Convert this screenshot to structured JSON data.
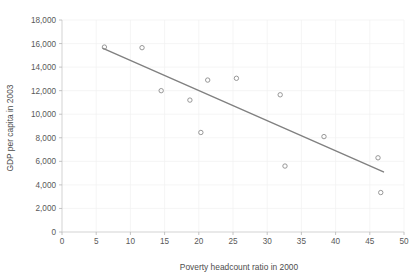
{
  "chart_data": {
    "type": "scatter",
    "title": "",
    "xlabel": "Poverty headcount ratio  in 2000",
    "ylabel": "GDP per capita in 2003",
    "xlim": [
      0,
      50
    ],
    "ylim": [
      0,
      18000
    ],
    "grid": true,
    "legend": "none",
    "xticks": [
      "0",
      "5",
      "10",
      "15",
      "20",
      "25",
      "30",
      "35",
      "40",
      "45",
      "50"
    ],
    "xtick_values": [
      0,
      5,
      10,
      15,
      20,
      25,
      30,
      35,
      40,
      45,
      50
    ],
    "yticks": [
      "0",
      "2,000",
      "4,000",
      "6,000",
      "8,000",
      "10,000",
      "12,000",
      "14,000",
      "16,000",
      "18,000"
    ],
    "ytick_values": [
      0,
      2000,
      4000,
      6000,
      8000,
      10000,
      12000,
      14000,
      16000,
      18000
    ],
    "points": [
      {
        "x": 6.2,
        "y": 15700
      },
      {
        "x": 11.7,
        "y": 15650
      },
      {
        "x": 14.5,
        "y": 12000
      },
      {
        "x": 18.7,
        "y": 11200
      },
      {
        "x": 20.3,
        "y": 8450
      },
      {
        "x": 21.3,
        "y": 12900
      },
      {
        "x": 25.5,
        "y": 13050
      },
      {
        "x": 31.9,
        "y": 11650
      },
      {
        "x": 32.6,
        "y": 5600
      },
      {
        "x": 38.3,
        "y": 8100
      },
      {
        "x": 46.2,
        "y": 6300
      },
      {
        "x": 46.6,
        "y": 3350
      }
    ],
    "trendline": {
      "x0": 6.0,
      "y0": 15600,
      "x1": 47.0,
      "y1": 5100
    },
    "colors": {
      "marker_stroke": "#8c8c8c",
      "trendline": "#808080",
      "gridline": "#f0f0f0",
      "axis": "#c8c8c8",
      "text": "#595959",
      "background": "#ffffff"
    }
  }
}
